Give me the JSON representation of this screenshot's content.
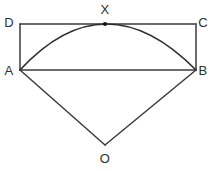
{
  "figure": {
    "background_color": "#ffffff",
    "line_color": "#3b3b3b",
    "arc_color": "#2e2e2e",
    "label_color": "#2f2f2f"
  },
  "labels": {
    "a": "A",
    "b": "B",
    "c": "C",
    "d": "D",
    "x": "X",
    "o": "O"
  },
  "points": {
    "A": {
      "x": 20,
      "y": 70
    },
    "B": {
      "x": 196,
      "y": 70
    },
    "C": {
      "x": 196,
      "y": 24
    },
    "D": {
      "x": 20,
      "y": 24
    },
    "X": {
      "x": 105,
      "y": 24
    },
    "O": {
      "x": 105,
      "y": 145
    }
  },
  "label_positions": {
    "A": {
      "x": 9,
      "y": 70
    },
    "B": {
      "x": 203,
      "y": 70
    },
    "C": {
      "x": 203,
      "y": 22
    },
    "D": {
      "x": 9,
      "y": 22
    },
    "X": {
      "x": 105,
      "y": 9
    },
    "O": {
      "x": 105,
      "y": 158
    }
  },
  "segments": [
    {
      "name": "segment-DC",
      "from": "D",
      "to": "C"
    },
    {
      "name": "segment-DA",
      "from": "D",
      "to": "A"
    },
    {
      "name": "segment-CB",
      "from": "C",
      "to": "B"
    },
    {
      "name": "segment-AB",
      "from": "A",
      "to": "B"
    },
    {
      "name": "segment-AO",
      "from": "A",
      "to": "O"
    },
    {
      "name": "segment-BO",
      "from": "B",
      "to": "O"
    }
  ],
  "arc": {
    "name": "arc-AXB",
    "from": "A",
    "through": "X",
    "to": "B",
    "path": "M 20 70 Q 105 -22 196 70",
    "tangent_point": "X"
  },
  "markers": [
    {
      "name": "point-marker-X",
      "at": "X",
      "radius": 2
    }
  ]
}
